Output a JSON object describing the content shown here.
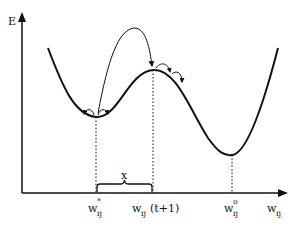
{
  "diagram": {
    "y_axis_label": "E",
    "x_axis_label": {
      "base": "w",
      "sub": "ij"
    },
    "brace_label": "x",
    "points": [
      {
        "id": "local-min",
        "base": "w",
        "sup": "*",
        "sub": "ij",
        "suffix": ""
      },
      {
        "id": "peak",
        "base": "w",
        "sup": "",
        "sub": "ij",
        "suffix": "(t+1)"
      },
      {
        "id": "global-min",
        "base": "w",
        "sup": "o",
        "sub": "ij",
        "suffix": ""
      }
    ],
    "colors": {
      "stroke": "#111111",
      "background": "#ffffff"
    }
  }
}
